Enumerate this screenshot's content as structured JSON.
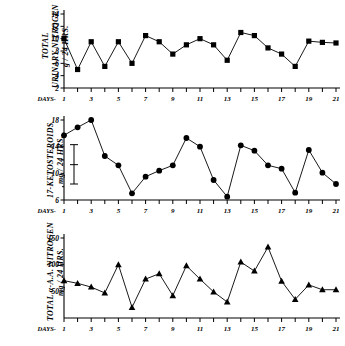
{
  "figure": {
    "background": "#ffffff",
    "ink": "#000000"
  },
  "panels": [
    {
      "id": "total-urinary-nitrogen",
      "ylabel": "TOTAL\nURINARY NITROGEN\ng / 24 HRS.",
      "xlabel_prefix": "DAYS-"
    },
    {
      "id": "17-ketosteroids",
      "ylabel": "17-KETOSTEROIDS\nmg / 24 HRS.",
      "xlabel_prefix": "DAYS-"
    },
    {
      "id": "total-alpha-amino-acid-nitrogen",
      "ylabel": "TOTAL α-A.A. NITROGEN\nmg / 24 HRS.",
      "xlabel_prefix": "DAYS-"
    }
  ],
  "chart_data": [
    {
      "type": "line",
      "title": "",
      "xlabel": "DAYS",
      "ylabel": "TOTAL URINARY NITROGEN g / 24 HRS.",
      "marker": "square",
      "x": [
        1,
        2,
        3,
        4,
        5,
        6,
        7,
        8,
        9,
        10,
        11,
        12,
        13,
        14,
        15,
        16,
        17,
        18,
        19,
        20,
        21
      ],
      "values": [
        10.0,
        5.0,
        9.5,
        5.5,
        9.5,
        6.0,
        10.5,
        9.5,
        7.5,
        9.0,
        10.0,
        9.0,
        6.5,
        11.0,
        10.5,
        8.5,
        7.5,
        5.5,
        9.6,
        9.4,
        9.3
      ],
      "xtick_labels": [
        "1",
        "3",
        "5",
        "7",
        "9",
        "11",
        "13",
        "15",
        "17",
        "19",
        "21"
      ],
      "xtick_values": [
        1,
        3,
        5,
        7,
        9,
        11,
        13,
        15,
        17,
        19,
        21
      ],
      "ytick_labels": [
        "2",
        "4",
        "6",
        "8",
        "10",
        "12",
        "14"
      ],
      "ytick_values": [
        2,
        4,
        6,
        8,
        10,
        12,
        14
      ],
      "ylim": [
        2,
        14
      ],
      "xlim": [
        1,
        21
      ],
      "grid": false,
      "legend": "none"
    },
    {
      "type": "line",
      "title": "",
      "xlabel": "DAYS",
      "ylabel": "17-KETOSTEROIDS mg / 24 HRS.",
      "marker": "circle",
      "x": [
        1,
        2,
        3,
        4,
        5,
        6,
        7,
        8,
        9,
        10,
        11,
        12,
        13,
        14,
        15,
        16,
        17,
        18,
        19,
        20,
        21
      ],
      "values": [
        15.7,
        16.9,
        18.0,
        12.6,
        11.2,
        7.0,
        9.5,
        10.4,
        11.2,
        15.3,
        14.0,
        9.0,
        6.5,
        14.2,
        13.4,
        11.2,
        10.7,
        7.1,
        13.5,
        10.1,
        8.4
      ],
      "xtick_labels": [
        "1",
        "3",
        "5",
        "7",
        "9",
        "11",
        "13",
        "15",
        "17",
        "19",
        "21"
      ],
      "xtick_values": [
        1,
        3,
        5,
        7,
        9,
        11,
        13,
        15,
        17,
        19,
        21
      ],
      "ytick_labels": [
        "6",
        "10",
        "14",
        "18"
      ],
      "ytick_values": [
        6,
        10,
        14,
        18
      ],
      "ylim": [
        6,
        18
      ],
      "xlim": [
        1,
        21
      ],
      "grid": false,
      "legend": "none",
      "annotations": [
        {
          "name": "reference-range-error-bar",
          "type": "errorbar",
          "upper": 14.3,
          "mean": 11.3,
          "lower": 8.4
        }
      ]
    },
    {
      "type": "line",
      "title": "",
      "xlabel": "DAYS",
      "ylabel": "TOTAL α-A.A. NITROGEN mg / 24 HRS.",
      "marker": "triangle",
      "x": [
        1,
        2,
        3,
        4,
        5,
        6,
        7,
        8,
        9,
        10,
        11,
        12,
        13,
        14,
        15,
        16,
        17,
        18,
        19,
        20,
        21
      ],
      "values": [
        70,
        65,
        58,
        47,
        100,
        20,
        73,
        83,
        42,
        98,
        73,
        49,
        30,
        105,
        88,
        133,
        69,
        35,
        62,
        53,
        53
      ],
      "xtick_labels": [
        "1",
        "3",
        "5",
        "7",
        "9",
        "11",
        "13",
        "15",
        "17",
        "19",
        "21"
      ],
      "xtick_values": [
        1,
        3,
        5,
        7,
        9,
        11,
        13,
        15,
        17,
        19,
        21
      ],
      "ytick_labels": [
        "50",
        "100",
        "150"
      ],
      "ytick_values": [
        50,
        100,
        150
      ],
      "ylim": [
        0,
        150
      ],
      "xlim": [
        1,
        21
      ],
      "grid": false,
      "legend": "none"
    }
  ]
}
